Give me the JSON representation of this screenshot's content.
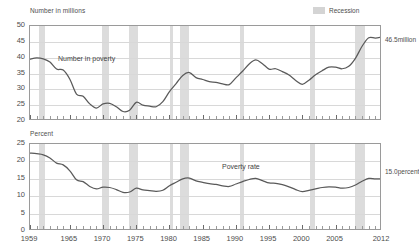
{
  "legend": {
    "recession_label": "Recession",
    "recession_color": "#dcdcdc"
  },
  "chart_data": [
    {
      "type": "line",
      "id": "number-in-poverty",
      "title": "",
      "ylabel": "Number in millions",
      "xlabel": "",
      "series_label": "Number in poverty",
      "end_label": "46.5million",
      "ylim": [
        20,
        50
      ],
      "yticks": [
        20,
        25,
        30,
        35,
        40,
        45,
        50
      ],
      "xlim": [
        1959,
        2012
      ],
      "xticks": [
        1959,
        1965,
        1970,
        1975,
        1980,
        1985,
        1990,
        1995,
        2000,
        2005,
        2012
      ],
      "grid": true,
      "line_color": "#5a5a5a",
      "x": [
        1959,
        1960,
        1961,
        1962,
        1963,
        1964,
        1965,
        1966,
        1967,
        1968,
        1969,
        1970,
        1971,
        1972,
        1973,
        1974,
        1975,
        1976,
        1977,
        1978,
        1979,
        1980,
        1981,
        1982,
        1983,
        1984,
        1985,
        1986,
        1987,
        1988,
        1989,
        1990,
        1991,
        1992,
        1993,
        1994,
        1995,
        1996,
        1997,
        1998,
        1999,
        2000,
        2001,
        2002,
        2003,
        2004,
        2005,
        2006,
        2007,
        2008,
        2009,
        2010,
        2011,
        2012
      ],
      "values": [
        39.5,
        39.9,
        39.6,
        38.6,
        36.4,
        36.1,
        33.2,
        28.5,
        27.8,
        25.4,
        24.1,
        25.4,
        25.6,
        24.5,
        23.0,
        23.4,
        25.9,
        25.0,
        24.7,
        24.5,
        26.1,
        29.3,
        31.8,
        34.4,
        35.3,
        33.7,
        33.1,
        32.4,
        32.2,
        31.7,
        31.5,
        33.6,
        35.7,
        38.0,
        39.3,
        38.1,
        36.4,
        36.5,
        35.6,
        34.5,
        32.8,
        31.6,
        32.9,
        34.6,
        35.9,
        37.0,
        37.0,
        36.5,
        37.3,
        39.8,
        43.6,
        46.3,
        46.2,
        46.5
      ],
      "recessions": [
        {
          "start": 1960.3,
          "end": 1961.2
        },
        {
          "start": 1969.9,
          "end": 1970.9
        },
        {
          "start": 1973.9,
          "end": 1975.2
        },
        {
          "start": 1980.1,
          "end": 1980.6
        },
        {
          "start": 1981.6,
          "end": 1982.9
        },
        {
          "start": 1990.6,
          "end": 1991.2
        },
        {
          "start": 2001.2,
          "end": 2001.9
        },
        {
          "start": 2007.9,
          "end": 2009.5
        }
      ]
    },
    {
      "type": "line",
      "id": "poverty-rate",
      "title": "",
      "ylabel": "Percent",
      "xlabel": "",
      "series_label": "Poverty rate",
      "end_label": "15.0percent",
      "ylim": [
        0,
        25
      ],
      "yticks": [
        0,
        5,
        10,
        15,
        20,
        25
      ],
      "xlim": [
        1959,
        2012
      ],
      "xticks": [
        1959,
        1965,
        1970,
        1975,
        1980,
        1985,
        1990,
        1995,
        2000,
        2005,
        2012
      ],
      "grid": true,
      "line_color": "#5a5a5a",
      "x": [
        1959,
        1960,
        1961,
        1962,
        1963,
        1964,
        1965,
        1966,
        1967,
        1968,
        1969,
        1970,
        1971,
        1972,
        1973,
        1974,
        1975,
        1976,
        1977,
        1978,
        1979,
        1980,
        1981,
        1982,
        1983,
        1984,
        1985,
        1986,
        1987,
        1988,
        1989,
        1990,
        1991,
        1992,
        1993,
        1994,
        1995,
        1996,
        1997,
        1998,
        1999,
        2000,
        2001,
        2002,
        2003,
        2004,
        2005,
        2006,
        2007,
        2008,
        2009,
        2010,
        2011,
        2012
      ],
      "values": [
        22.4,
        22.2,
        21.9,
        21.0,
        19.5,
        19.0,
        17.3,
        14.7,
        14.2,
        12.8,
        12.1,
        12.6,
        12.5,
        11.9,
        11.1,
        11.2,
        12.3,
        11.8,
        11.6,
        11.4,
        11.7,
        13.0,
        14.0,
        15.0,
        15.2,
        14.4,
        14.0,
        13.6,
        13.4,
        13.0,
        12.8,
        13.5,
        14.2,
        14.8,
        15.1,
        14.5,
        13.8,
        13.7,
        13.3,
        12.7,
        11.9,
        11.3,
        11.7,
        12.1,
        12.5,
        12.7,
        12.6,
        12.3,
        12.5,
        13.2,
        14.3,
        15.1,
        15.0,
        15.0
      ],
      "recessions": [
        {
          "start": 1960.3,
          "end": 1961.2
        },
        {
          "start": 1969.9,
          "end": 1970.9
        },
        {
          "start": 1973.9,
          "end": 1975.2
        },
        {
          "start": 1980.1,
          "end": 1980.6
        },
        {
          "start": 1981.6,
          "end": 1982.9
        },
        {
          "start": 1990.6,
          "end": 1991.2
        },
        {
          "start": 2001.2,
          "end": 2001.9
        },
        {
          "start": 2007.9,
          "end": 2009.5
        }
      ]
    }
  ]
}
